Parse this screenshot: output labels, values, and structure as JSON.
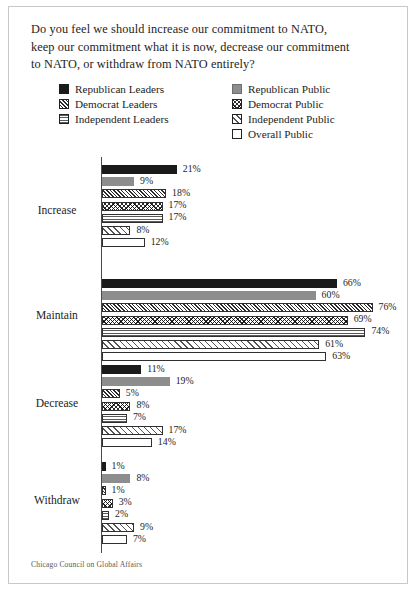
{
  "figure": {
    "question_lines": [
      "Do you feel we should increase our commitment to NATO,",
      "keep our commitment what it is now, decrease our commitment",
      "to NATO, or withdraw from NATO entirely?"
    ],
    "question_full": "Do you feel we should increase our commitment to NATO, keep our commitment what it is now, decrease our commitment to NATO, or withdraw from NATO entirely?",
    "source_note": "Chicago Council on Global Affairs"
  },
  "legend": {
    "left_column": [
      {
        "label": "Republican Leaders",
        "pattern": "solid-black",
        "icon": "swatch-solid-black-icon"
      },
      {
        "label": "Democrat Leaders",
        "pattern": "diag-dense",
        "icon": "swatch-diagonal-hatch-icon"
      },
      {
        "label": "Independent Leaders",
        "pattern": "speckle",
        "icon": "swatch-dotted-icon"
      }
    ],
    "right_column": [
      {
        "label": "Republican Public",
        "pattern": "solid-gray",
        "icon": "swatch-solid-gray-icon"
      },
      {
        "label": "Democrat Public",
        "pattern": "cross",
        "icon": "swatch-crosshatch-icon"
      },
      {
        "label": "Independent Public",
        "pattern": "diag-sparse",
        "icon": "swatch-sparse-hatch-icon"
      },
      {
        "label": "Overall Public",
        "pattern": "empty",
        "icon": "swatch-empty-icon"
      }
    ]
  },
  "chart_data": {
    "type": "bar",
    "orientation": "horizontal",
    "title": "Do you feel we should increase our commitment to NATO, keep our commitment what it is now, decrease our commitment to NATO, or withdraw from NATO entirely?",
    "xlabel": "",
    "ylabel": "",
    "xlim": [
      0,
      80
    ],
    "grid": false,
    "legend_position": "top",
    "value_suffix": "%",
    "categories": [
      "Increase",
      "Maintain",
      "Decrease",
      "Withdraw"
    ],
    "series": [
      {
        "name": "Republican Leaders",
        "pattern": "solid-black",
        "values": [
          21,
          66,
          11,
          1
        ]
      },
      {
        "name": "Republican Public",
        "pattern": "solid-gray",
        "values": [
          9,
          60,
          19,
          8
        ]
      },
      {
        "name": "Democrat Leaders",
        "pattern": "diag-dense",
        "values": [
          18,
          76,
          5,
          1
        ]
      },
      {
        "name": "Democrat Public",
        "pattern": "cross",
        "values": [
          17,
          69,
          8,
          3
        ]
      },
      {
        "name": "Independent Leaders",
        "pattern": "speckle",
        "values": [
          17,
          74,
          7,
          2
        ]
      },
      {
        "name": "Independent Public",
        "pattern": "diag-sparse",
        "values": [
          8,
          61,
          17,
          9
        ]
      },
      {
        "name": "Overall Public",
        "pattern": "empty",
        "values": [
          12,
          63,
          14,
          7
        ]
      }
    ],
    "labels": {
      "Increase": [
        "21%",
        "9%",
        "18%",
        "17%",
        "17%",
        "8%",
        "12%"
      ],
      "Maintain": [
        "66%",
        "60%",
        "76%",
        "69%",
        "74%",
        "61%",
        "63%"
      ],
      "Decrease": [
        "11%",
        "19%",
        "5%",
        "8%",
        "7%",
        "17%",
        "14%"
      ],
      "Withdraw": [
        "1%",
        "8%",
        "1%",
        "3%",
        "2%",
        "9%",
        "7%"
      ]
    }
  },
  "colors": {
    "republican_leaders": "#1a1a1a",
    "republican_public": "#8d8d8d",
    "axis": "#4a4a4a",
    "text": "#1d1d1d",
    "border": "#c8c8c8"
  }
}
